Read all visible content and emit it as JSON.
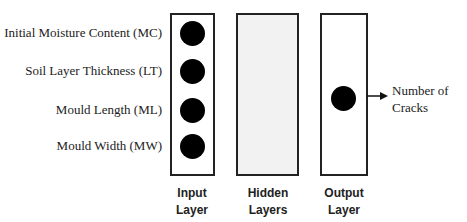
{
  "diagram": {
    "input_features": [
      {
        "label": "Initial Moisture Content (MC)"
      },
      {
        "label": "Soil Layer Thickness (LT)"
      },
      {
        "label": "Mould Length (ML)"
      },
      {
        "label": "Mould Width (MW)"
      }
    ],
    "layers": {
      "input": {
        "caption_line1": "Input",
        "caption_line2": "Layer"
      },
      "hidden": {
        "caption_line1": "Hidden",
        "caption_line2": "Layers",
        "fill": "#f2f2f2"
      },
      "output": {
        "caption_line1": "Output",
        "caption_line2": "Layer"
      }
    },
    "output": {
      "line1": "Number of",
      "line2": "Cracks"
    }
  }
}
